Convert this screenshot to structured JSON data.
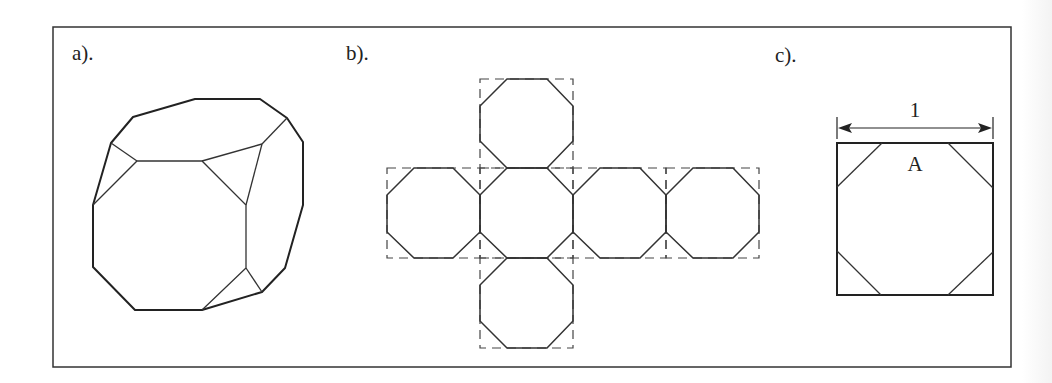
{
  "figure": {
    "panels": [
      {
        "id": "a",
        "label": "a).",
        "description": "truncated cube (perspective view)"
      },
      {
        "id": "b",
        "label": "b).",
        "description": "net of truncated cube: six octagons inscribed in dashed squares (cross layout)"
      },
      {
        "id": "c",
        "label": "c).",
        "description": "unit square with corners cut off forming octagon"
      }
    ],
    "panel_c": {
      "dimension_label": "1",
      "face_label": "A"
    },
    "colors": {
      "line": "#222222",
      "background": "#ffffff"
    }
  }
}
